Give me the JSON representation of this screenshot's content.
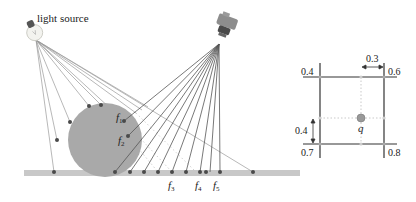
{
  "scene": {
    "light_source": {
      "label": "light source",
      "icon": "lightbulb-icon"
    },
    "camera": {
      "icon": "camera-icon"
    },
    "feature_labels": [
      {
        "base": "f",
        "sub": "1"
      },
      {
        "base": "f",
        "sub": "2"
      },
      {
        "base": "f",
        "sub": "3"
      },
      {
        "base": "f",
        "sub": "4"
      },
      {
        "base": "f",
        "sub": "5"
      }
    ],
    "colors": {
      "sphere": "#a9a9a9",
      "ground": "#c8c8c8",
      "ray": "#8a8a8a",
      "camera_ray": "#555555",
      "point": "#4a4a4a"
    }
  },
  "grid": {
    "corner_values": {
      "top_left": "0.4",
      "top_right": "0.6",
      "bottom_left": "0.7",
      "bottom_right": "0.8"
    },
    "horizontal_offset": "0.3",
    "vertical_offset": "0.4",
    "query_point_label": "q",
    "colors": {
      "line": "#333333",
      "query": "#999999",
      "dotted": "#bbbbbb"
    }
  }
}
